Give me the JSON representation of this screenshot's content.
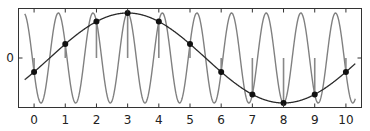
{
  "chart_data": {
    "type": "line",
    "title": "",
    "xlabel": "",
    "ylabel": "",
    "xlim": [
      -0.5,
      10.5
    ],
    "ylim": [
      -1.1,
      1.1
    ],
    "grid": false,
    "legend": null,
    "x_ticks": [
      0,
      1,
      2,
      3,
      4,
      5,
      6,
      7,
      8,
      9,
      10
    ],
    "x_tick_labels": [
      "0",
      "1",
      "2",
      "3",
      "4",
      "5",
      "6",
      "7",
      "8",
      "9",
      "10"
    ],
    "y_ticks": [
      0
    ],
    "y_tick_labels": [
      "0"
    ],
    "series": [
      {
        "name": "high-frequency signal",
        "kind": "line",
        "formula": "cos(2*pi*0.9*(x-3))",
        "x_range": [
          -0.3,
          10.3
        ],
        "color": "#777777"
      },
      {
        "name": "alias (low-frequency) signal",
        "kind": "line",
        "formula": "cos(2*pi*0.1*(x-3))",
        "x_range": [
          -0.3,
          10.3
        ],
        "color": "#333333"
      },
      {
        "name": "samples",
        "kind": "stem",
        "x": [
          0,
          1,
          2,
          3,
          4,
          5,
          6,
          7,
          8,
          9,
          10
        ],
        "values": [
          -0.309,
          0.309,
          0.809,
          1.0,
          0.809,
          0.309,
          -0.309,
          -0.809,
          -1.0,
          -0.809,
          -0.309
        ],
        "color": "#111111"
      }
    ],
    "annotations": []
  },
  "colors": {
    "frame": "#333333",
    "high_freq": "#808080",
    "alias": "#2a2a2a",
    "stem": "#888888",
    "marker": "#111111",
    "background": "#ffffff"
  }
}
